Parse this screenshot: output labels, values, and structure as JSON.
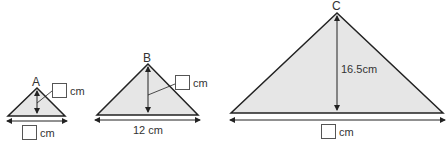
{
  "colors": {
    "fill": "#e6e6e6",
    "stroke": "#222222",
    "text": "#333333"
  },
  "triangles": [
    {
      "id": "A",
      "label": "A",
      "base_label": "cm",
      "height_label": "cm",
      "base_value": "",
      "height_value": ""
    },
    {
      "id": "B",
      "label": "B",
      "base_label": "12 cm",
      "height_label": "cm",
      "height_value": ""
    },
    {
      "id": "C",
      "label": "C",
      "height_label": "16.5cm",
      "base_label": "cm",
      "base_value": ""
    }
  ]
}
